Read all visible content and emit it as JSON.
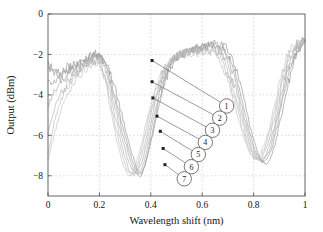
{
  "chart_data": {
    "type": "line",
    "title": "",
    "xlabel": "Wavelength shift (nm)",
    "ylabel": "Output (dBm)",
    "xlim": [
      0,
      1
    ],
    "ylim": [
      -9,
      0
    ],
    "xticks": [
      "0",
      "0.2",
      "0.4",
      "0.6",
      "0.8",
      "1"
    ],
    "xtick_values": [
      0,
      0.2,
      0.4,
      0.6,
      0.8,
      1
    ],
    "yticks": [
      "0",
      "-2",
      "-4",
      "-6",
      "-8"
    ],
    "ytick_values": [
      0,
      -2,
      -4,
      -6,
      -8
    ],
    "grid": true,
    "grid_style": "dashed",
    "legend": "none",
    "series": [
      {
        "name": "1",
        "color": "#8a8a8a",
        "x": [
          0.0,
          0.02,
          0.04,
          0.06,
          0.08,
          0.1,
          0.12,
          0.14,
          0.16,
          0.18,
          0.2,
          0.22,
          0.24,
          0.26,
          0.28,
          0.3,
          0.32,
          0.34,
          0.36,
          0.38,
          0.4,
          0.42,
          0.44,
          0.46,
          0.48,
          0.5,
          0.52,
          0.54,
          0.56,
          0.58,
          0.6,
          0.62,
          0.64,
          0.66,
          0.68,
          0.7,
          0.72,
          0.74,
          0.76,
          0.78,
          0.8,
          0.82,
          0.84,
          0.86,
          0.88,
          0.9,
          0.92,
          0.94,
          0.96,
          0.98,
          1.0
        ],
        "y": [
          -2.5,
          -2.7,
          -2.9,
          -2.8,
          -2.6,
          -2.5,
          -2.4,
          -2.3,
          -2.1,
          -2.0,
          -2.0,
          -2.2,
          -2.8,
          -3.6,
          -4.6,
          -5.6,
          -6.6,
          -7.4,
          -7.9,
          -7.4,
          -6.4,
          -5.2,
          -4.1,
          -3.2,
          -2.6,
          -2.2,
          -2.0,
          -1.9,
          -1.8,
          -1.8,
          -1.7,
          -1.6,
          -1.5,
          -1.5,
          -1.6,
          -1.8,
          -2.3,
          -3.1,
          -4.1,
          -5.2,
          -6.2,
          -7.0,
          -7.4,
          -7.3,
          -6.6,
          -5.5,
          -4.3,
          -3.2,
          -2.3,
          -1.7,
          -1.3
        ]
      },
      {
        "name": "2",
        "color": "#949494",
        "x": [
          0.0,
          0.02,
          0.04,
          0.06,
          0.08,
          0.1,
          0.12,
          0.14,
          0.16,
          0.18,
          0.2,
          0.22,
          0.24,
          0.26,
          0.28,
          0.3,
          0.32,
          0.34,
          0.36,
          0.38,
          0.4,
          0.42,
          0.44,
          0.46,
          0.48,
          0.5,
          0.52,
          0.54,
          0.56,
          0.58,
          0.6,
          0.62,
          0.64,
          0.66,
          0.68,
          0.7,
          0.72,
          0.74,
          0.76,
          0.78,
          0.8,
          0.82,
          0.84,
          0.86,
          0.88,
          0.9,
          0.92,
          0.94,
          0.96,
          0.98,
          1.0
        ],
        "y": [
          -2.6,
          -2.8,
          -3.0,
          -2.9,
          -2.7,
          -2.6,
          -2.5,
          -2.3,
          -2.2,
          -2.1,
          -2.1,
          -2.4,
          -3.1,
          -4.0,
          -5.0,
          -6.0,
          -6.9,
          -7.6,
          -8.0,
          -7.3,
          -6.2,
          -4.9,
          -3.8,
          -3.0,
          -2.5,
          -2.2,
          -2.0,
          -1.9,
          -1.8,
          -1.7,
          -1.6,
          -1.6,
          -1.5,
          -1.5,
          -1.7,
          -2.0,
          -2.6,
          -3.5,
          -4.5,
          -5.6,
          -6.5,
          -7.1,
          -7.3,
          -7.0,
          -6.2,
          -5.0,
          -3.8,
          -2.8,
          -2.1,
          -1.6,
          -1.3
        ]
      },
      {
        "name": "3",
        "color": "#9e9e9e",
        "x": [
          0.0,
          0.02,
          0.04,
          0.06,
          0.08,
          0.1,
          0.12,
          0.14,
          0.16,
          0.18,
          0.2,
          0.22,
          0.24,
          0.26,
          0.28,
          0.3,
          0.32,
          0.34,
          0.36,
          0.38,
          0.4,
          0.42,
          0.44,
          0.46,
          0.48,
          0.5,
          0.52,
          0.54,
          0.56,
          0.58,
          0.6,
          0.62,
          0.64,
          0.66,
          0.68,
          0.7,
          0.72,
          0.74,
          0.76,
          0.78,
          0.8,
          0.82,
          0.84,
          0.86,
          0.88,
          0.9,
          0.92,
          0.94,
          0.96,
          0.98,
          1.0
        ],
        "y": [
          -3.2,
          -3.4,
          -3.3,
          -3.1,
          -2.9,
          -2.7,
          -2.6,
          -2.4,
          -2.3,
          -2.1,
          -2.1,
          -2.5,
          -3.3,
          -4.3,
          -5.3,
          -6.3,
          -7.2,
          -7.8,
          -7.8,
          -7.0,
          -5.8,
          -4.6,
          -3.6,
          -2.9,
          -2.4,
          -2.1,
          -2.0,
          -1.9,
          -1.8,
          -1.7,
          -1.6,
          -1.6,
          -1.5,
          -1.6,
          -1.8,
          -2.2,
          -2.9,
          -3.8,
          -4.9,
          -5.9,
          -6.7,
          -7.2,
          -7.2,
          -6.8,
          -5.9,
          -4.7,
          -3.5,
          -2.6,
          -2.0,
          -1.5,
          -1.3
        ]
      },
      {
        "name": "4",
        "color": "#a8a8a8",
        "x": [
          0.0,
          0.02,
          0.04,
          0.06,
          0.08,
          0.1,
          0.12,
          0.14,
          0.16,
          0.18,
          0.2,
          0.22,
          0.24,
          0.26,
          0.28,
          0.3,
          0.32,
          0.34,
          0.36,
          0.38,
          0.4,
          0.42,
          0.44,
          0.46,
          0.48,
          0.5,
          0.52,
          0.54,
          0.56,
          0.58,
          0.6,
          0.62,
          0.64,
          0.66,
          0.68,
          0.7,
          0.72,
          0.74,
          0.76,
          0.78,
          0.8,
          0.82,
          0.84,
          0.86,
          0.88,
          0.9,
          0.92,
          0.94,
          0.96,
          0.98,
          1.0
        ],
        "y": [
          -4.5,
          -4.0,
          -3.6,
          -3.3,
          -3.0,
          -2.8,
          -2.7,
          -2.5,
          -2.3,
          -2.2,
          -2.2,
          -2.7,
          -3.6,
          -4.6,
          -5.7,
          -6.7,
          -7.5,
          -7.9,
          -7.5,
          -6.6,
          -5.4,
          -4.3,
          -3.4,
          -2.8,
          -2.4,
          -2.1,
          -2.0,
          -1.9,
          -1.8,
          -1.7,
          -1.7,
          -1.6,
          -1.6,
          -1.7,
          -2.0,
          -2.5,
          -3.3,
          -4.2,
          -5.2,
          -6.2,
          -6.9,
          -7.2,
          -7.1,
          -6.5,
          -5.6,
          -4.4,
          -3.3,
          -2.4,
          -1.8,
          -1.5,
          -1.3
        ]
      },
      {
        "name": "5",
        "color": "#b0b0b0",
        "x": [
          0.0,
          0.02,
          0.04,
          0.06,
          0.08,
          0.1,
          0.12,
          0.14,
          0.16,
          0.18,
          0.2,
          0.22,
          0.24,
          0.26,
          0.28,
          0.3,
          0.32,
          0.34,
          0.36,
          0.38,
          0.4,
          0.42,
          0.44,
          0.46,
          0.48,
          0.5,
          0.52,
          0.54,
          0.56,
          0.58,
          0.6,
          0.62,
          0.64,
          0.66,
          0.68,
          0.7,
          0.72,
          0.74,
          0.76,
          0.78,
          0.8,
          0.82,
          0.84,
          0.86,
          0.88,
          0.9,
          0.92,
          0.94,
          0.96,
          0.98,
          1.0
        ],
        "y": [
          -5.9,
          -4.9,
          -4.2,
          -3.7,
          -3.3,
          -3.0,
          -2.8,
          -2.6,
          -2.4,
          -2.3,
          -2.3,
          -2.9,
          -3.9,
          -5.0,
          -6.1,
          -7.1,
          -7.8,
          -7.9,
          -7.2,
          -6.2,
          -5.0,
          -4.0,
          -3.2,
          -2.7,
          -2.3,
          -2.1,
          -2.0,
          -1.9,
          -1.8,
          -1.8,
          -1.7,
          -1.7,
          -1.7,
          -1.9,
          -2.2,
          -2.8,
          -3.6,
          -4.5,
          -5.5,
          -6.4,
          -7.0,
          -7.2,
          -6.9,
          -6.2,
          -5.2,
          -4.1,
          -3.0,
          -2.2,
          -1.7,
          -1.4,
          -1.3
        ]
      },
      {
        "name": "6",
        "color": "#b8b8b8",
        "x": [
          0.0,
          0.02,
          0.04,
          0.06,
          0.08,
          0.1,
          0.12,
          0.14,
          0.16,
          0.18,
          0.2,
          0.22,
          0.24,
          0.26,
          0.28,
          0.3,
          0.32,
          0.34,
          0.36,
          0.38,
          0.4,
          0.42,
          0.44,
          0.46,
          0.48,
          0.5,
          0.52,
          0.54,
          0.56,
          0.58,
          0.6,
          0.62,
          0.64,
          0.66,
          0.68,
          0.7,
          0.72,
          0.74,
          0.76,
          0.78,
          0.8,
          0.82,
          0.84,
          0.86,
          0.88,
          0.9,
          0.92,
          0.94,
          0.96,
          0.98,
          1.0
        ],
        "y": [
          -6.9,
          -5.6,
          -4.7,
          -4.0,
          -3.5,
          -3.2,
          -2.9,
          -2.7,
          -2.5,
          -2.4,
          -2.4,
          -3.1,
          -4.2,
          -5.4,
          -6.5,
          -7.4,
          -7.9,
          -7.7,
          -6.9,
          -5.8,
          -4.7,
          -3.8,
          -3.1,
          -2.6,
          -2.3,
          -2.1,
          -2.0,
          -1.9,
          -1.9,
          -1.8,
          -1.8,
          -1.8,
          -1.8,
          -2.0,
          -2.4,
          -3.1,
          -3.9,
          -4.8,
          -5.8,
          -6.6,
          -7.1,
          -7.1,
          -6.7,
          -5.9,
          -4.9,
          -3.8,
          -2.8,
          -2.0,
          -1.6,
          -1.4,
          -1.3
        ]
      },
      {
        "name": "7",
        "color": "#c0c0c0",
        "x": [
          0.0,
          0.02,
          0.04,
          0.06,
          0.08,
          0.1,
          0.12,
          0.14,
          0.16,
          0.18,
          0.2,
          0.22,
          0.24,
          0.26,
          0.28,
          0.3,
          0.32,
          0.34,
          0.36,
          0.38,
          0.4,
          0.42,
          0.44,
          0.46,
          0.48,
          0.5,
          0.52,
          0.54,
          0.56,
          0.58,
          0.6,
          0.62,
          0.64,
          0.66,
          0.68,
          0.7,
          0.72,
          0.74,
          0.76,
          0.78,
          0.8,
          0.82,
          0.84,
          0.86,
          0.88,
          0.9,
          0.92,
          0.94,
          0.96,
          0.98,
          1.0
        ],
        "y": [
          -7.2,
          -6.2,
          -5.2,
          -4.4,
          -3.8,
          -3.4,
          -3.1,
          -2.8,
          -2.6,
          -2.5,
          -2.5,
          -3.3,
          -4.5,
          -5.8,
          -6.9,
          -7.7,
          -8.0,
          -7.5,
          -6.6,
          -5.5,
          -4.5,
          -3.6,
          -3.0,
          -2.6,
          -2.3,
          -2.1,
          -2.0,
          -2.0,
          -1.9,
          -1.9,
          -1.9,
          -1.9,
          -1.9,
          -2.1,
          -2.6,
          -3.3,
          -4.2,
          -5.1,
          -6.0,
          -6.7,
          -7.1,
          -7.0,
          -6.5,
          -5.7,
          -4.6,
          -3.5,
          -2.5,
          -1.9,
          -1.5,
          -1.4,
          -1.3
        ]
      }
    ],
    "annotations": [
      {
        "label": "1",
        "marker_x": 0.405,
        "marker_y": -2.3,
        "circle_x": 0.695,
        "circle_y": -4.55
      },
      {
        "label": "2",
        "marker_x": 0.405,
        "marker_y": -3.35,
        "circle_x": 0.668,
        "circle_y": -5.15
      },
      {
        "label": "3",
        "marker_x": 0.408,
        "marker_y": -4.15,
        "circle_x": 0.64,
        "circle_y": -5.75
      },
      {
        "label": "4",
        "marker_x": 0.424,
        "marker_y": -5.05,
        "circle_x": 0.612,
        "circle_y": -6.35
      },
      {
        "label": "5",
        "marker_x": 0.437,
        "marker_y": -5.8,
        "circle_x": 0.585,
        "circle_y": -6.95
      },
      {
        "label": "6",
        "marker_x": 0.448,
        "marker_y": -6.65,
        "circle_x": 0.558,
        "circle_y": -7.55
      },
      {
        "label": "7",
        "marker_x": 0.455,
        "marker_y": -7.45,
        "circle_x": 0.53,
        "circle_y": -8.15
      }
    ],
    "colors": {
      "axis": "#555555",
      "grid": "#c8c8c8",
      "text": "#141414",
      "background": "#ffffff",
      "annotation": "#4a4a4a"
    }
  }
}
